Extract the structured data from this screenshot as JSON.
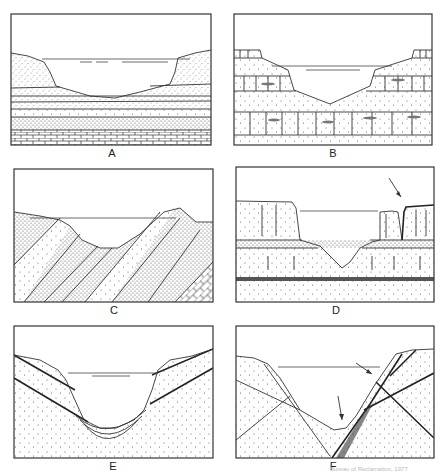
{
  "figure": {
    "panels": [
      {
        "id": "A",
        "label": "A",
        "description": "Flat-lying sedimentary strata with limestone base; reservoir in broad valley"
      },
      {
        "id": "B",
        "label": "B",
        "description": "Flat-lying alternating beds with jointed layers; V-shaped valley reservoir"
      },
      {
        "id": "C",
        "label": "C",
        "description": "Steeply dipping tilted strata; reservoir across folded beds"
      },
      {
        "id": "D",
        "label": "D",
        "description": "Jointed cliff-forming beds over shale; arrow marks detached block at right rim"
      },
      {
        "id": "E",
        "label": "E",
        "description": "Dipping beds with U-shaped valley and bent layers beneath floor"
      },
      {
        "id": "F",
        "label": "F",
        "description": "Faulted and fractured rock; arrows mark fault zones crossing valley"
      }
    ],
    "credit": "Bureau of Reclamation, 1977"
  }
}
